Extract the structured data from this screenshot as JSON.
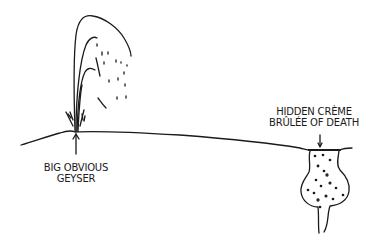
{
  "comic": {
    "labels": {
      "geyser": {
        "line1": "BIG OBVIOUS",
        "line2": "GEYSER"
      },
      "creme_brulee": {
        "line1": "HIDDEN CRÈME",
        "line2": "BRÛLÉE OF DEATH"
      }
    },
    "colors": {
      "ink": "#1a1a1a",
      "background": "#ffffff"
    }
  }
}
